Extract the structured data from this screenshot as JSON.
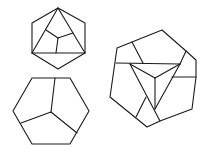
{
  "figure": {
    "width": 204,
    "height": 156,
    "background": "#ffffff",
    "stroke_color": "#1a1a1a",
    "shapes": [
      {
        "name": "top-hexagon-with-inscribed-triangle",
        "outline": [
          [
            58,
            8
          ],
          [
            85,
            23
          ],
          [
            85,
            53
          ],
          [
            58,
            69
          ],
          [
            32,
            53
          ],
          [
            32,
            23
          ]
        ],
        "segments": [
          [
            [
              58,
              8
            ],
            [
              32,
              53
            ]
          ],
          [
            [
              58,
              8
            ],
            [
              85,
              53
            ]
          ],
          [
            [
              32,
              53
            ],
            [
              85,
              53
            ]
          ],
          [
            [
              58,
              38
            ],
            [
              46,
              30
            ]
          ],
          [
            [
              58,
              38
            ],
            [
              73,
              33
            ]
          ],
          [
            [
              58,
              38
            ],
            [
              56,
              53
            ]
          ]
        ]
      },
      {
        "name": "bottom-left-hexagon-divided",
        "outline": [
          [
            32,
            78
          ],
          [
            70,
            78
          ],
          [
            89,
            111
          ],
          [
            70,
            144
          ],
          [
            32,
            144
          ],
          [
            13,
            111
          ]
        ],
        "segments": [
          [
            [
              51,
              112
            ],
            [
              55,
              78
            ]
          ],
          [
            [
              51,
              112
            ],
            [
              21,
              123
            ]
          ],
          [
            [
              51,
              112
            ],
            [
              77,
              133
            ]
          ]
        ]
      },
      {
        "name": "right-polygon-with-central-triangle",
        "outline": [
          [
            117,
            48
          ],
          [
            132,
            42
          ],
          [
            162,
            30
          ],
          [
            186,
            51
          ],
          [
            196,
            60
          ],
          [
            196,
            77
          ],
          [
            192,
            109
          ],
          [
            160,
            121
          ],
          [
            147,
            127
          ],
          [
            110,
            97
          ]
        ],
        "segments": [
          [
            [
              116,
              63
            ],
            [
              180,
              64
            ]
          ],
          [
            [
              132,
              42
            ],
            [
              143,
              63
            ]
          ],
          [
            [
              186,
              51
            ],
            [
              180,
              64
            ]
          ],
          [
            [
              172,
              77
            ],
            [
              196,
              77
            ]
          ],
          [
            [
              130,
              64
            ],
            [
              160,
              121
            ]
          ],
          [
            [
              180,
              64
            ],
            [
              155,
              109
            ]
          ],
          [
            [
              155,
              78
            ],
            [
              130,
              64
            ]
          ],
          [
            [
              155,
              78
            ],
            [
              180,
              64
            ]
          ],
          [
            [
              155,
              78
            ],
            [
              155,
              109
            ]
          ],
          [
            [
              146,
              97
            ],
            [
              136,
              117
            ]
          ]
        ]
      }
    ]
  }
}
